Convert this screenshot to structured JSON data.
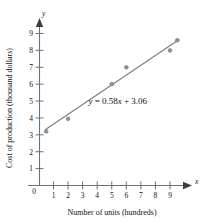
{
  "chart_data": {
    "type": "scatter",
    "title": "",
    "xlabel": "Number of units (hundreds)",
    "ylabel": "Cost of production (thousand dollars)",
    "xlim": [
      0,
      10.2
    ],
    "ylim": [
      0,
      9.6
    ],
    "grid": false,
    "legend": "none",
    "x_ticks": [
      1,
      2,
      3,
      4,
      5,
      6,
      7,
      8,
      9
    ],
    "y_ticks": [
      1,
      2,
      3,
      4,
      5,
      6,
      7,
      8,
      9
    ],
    "origin_label": "0",
    "x_axis_letter": "x",
    "y_axis_letter": "y",
    "points": [
      {
        "x": 0.5,
        "y": 3.2
      },
      {
        "x": 2.0,
        "y": 3.95
      },
      {
        "x": 5.0,
        "y": 6.0
      },
      {
        "x": 6.0,
        "y": 7.0
      },
      {
        "x": 9.0,
        "y": 8.0
      },
      {
        "x": 9.5,
        "y": 8.6
      }
    ],
    "fit_line": {
      "slope": 0.58,
      "intercept": 3.06,
      "x_start": 0.45,
      "x_end": 9.6
    },
    "annotations": [
      {
        "name": "regression-equation",
        "text": "y = 0.58x + 3.06",
        "parts": {
          "lhs_var": "y",
          "equals": " = ",
          "slope": "0.58",
          "slope_var": "x",
          "plus": " + ",
          "intercept": "3.06"
        },
        "x": 3.4,
        "y": 4.85
      }
    ]
  },
  "colors": {
    "axis": "#6b707a",
    "line": "#7a7f8a",
    "point_fill": "#8d929c",
    "arrow": "#3a3d42",
    "text": "#111111",
    "background": "#ffffff"
  }
}
